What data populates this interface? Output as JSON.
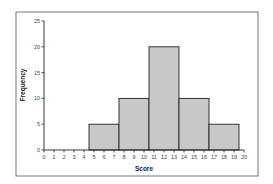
{
  "chart_data": {
    "type": "bar",
    "subtype": "histogram",
    "title": "",
    "xlabel": "Score",
    "ylabel": "Frequency",
    "xlim": [
      0,
      20
    ],
    "ylim": [
      0,
      25
    ],
    "x_ticks": [
      0,
      1,
      2,
      3,
      4,
      5,
      6,
      7,
      8,
      9,
      10,
      11,
      12,
      13,
      14,
      15,
      16,
      17,
      18,
      19,
      20
    ],
    "y_ticks": [
      0,
      5,
      10,
      15,
      20,
      25
    ],
    "bins": [
      {
        "start": 4.5,
        "end": 7.5,
        "value": 5
      },
      {
        "start": 7.5,
        "end": 10.5,
        "value": 10
      },
      {
        "start": 10.5,
        "end": 13.5,
        "value": 20
      },
      {
        "start": 13.5,
        "end": 16.5,
        "value": 10
      },
      {
        "start": 16.5,
        "end": 19.5,
        "value": 5
      }
    ],
    "categories": [
      "4.5-7.5",
      "7.5-10.5",
      "10.5-13.5",
      "13.5-16.5",
      "16.5-19.5"
    ],
    "values": [
      5,
      10,
      20,
      10,
      5
    ],
    "grid": false,
    "legend": null,
    "colors": {
      "bar_fill": "#c8c8c8",
      "bar_stroke": "#222222",
      "frame": "#555555"
    }
  }
}
